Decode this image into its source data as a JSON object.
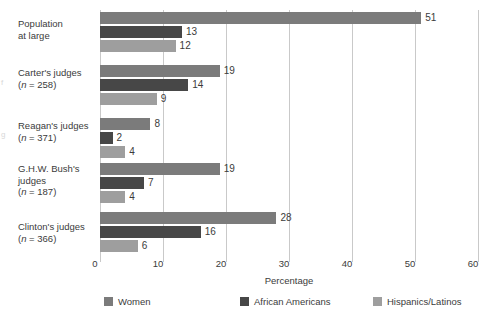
{
  "chart_data": {
    "type": "bar",
    "orientation": "horizontal",
    "title": "",
    "xlabel": "Percentage",
    "ylabel": "",
    "xlim": [
      0,
      60
    ],
    "xticks": [
      0,
      10,
      20,
      30,
      40,
      50,
      60
    ],
    "grid": "vertical",
    "legend_position": "bottom",
    "categories": [
      "Population at large",
      "Carter's judges (n = 258)",
      "Reagan's judges (n = 371)",
      "G.H.W. Bush's judges (n = 187)",
      "Clinton's judges (n = 366)"
    ],
    "series": [
      {
        "name": "Women",
        "color": "#7b7b7b",
        "values": [
          51,
          19,
          8,
          19,
          28
        ]
      },
      {
        "name": "African Americans",
        "color": "#474747",
        "values": [
          13,
          14,
          2,
          7,
          16
        ]
      },
      {
        "name": "Hispanics/Latinos",
        "color": "#9e9e9e",
        "values": [
          12,
          9,
          4,
          4,
          6
        ]
      }
    ]
  },
  "axis": {
    "x_title": "Percentage",
    "ticks": [
      "0",
      "10",
      "20",
      "30",
      "40",
      "50",
      "60"
    ]
  },
  "groups": [
    {
      "lines": [
        "Population",
        "at large"
      ],
      "n_label": "",
      "values": {
        "women": "51",
        "african": "13",
        "hispanic": "12"
      }
    },
    {
      "lines": [
        "Carter's judges"
      ],
      "n_label": "(n = 258)",
      "values": {
        "women": "19",
        "african": "14",
        "hispanic": "9"
      }
    },
    {
      "lines": [
        "Reagan's judges"
      ],
      "n_label": "(n = 371)",
      "values": {
        "women": "8",
        "african": "2",
        "hispanic": "4"
      }
    },
    {
      "lines": [
        "G.H.W. Bush's",
        "judges"
      ],
      "n_label": "(n = 187)",
      "values": {
        "women": "19",
        "african": "7",
        "hispanic": "4"
      }
    },
    {
      "lines": [
        "Clinton's judges"
      ],
      "n_label": "(n = 366)",
      "values": {
        "women": "28",
        "african": "16",
        "hispanic": "6"
      }
    }
  ],
  "legend": {
    "items": [
      {
        "label": "Women",
        "color": "#7b7b7b"
      },
      {
        "label": "African Americans",
        "color": "#474747"
      },
      {
        "label": "Hispanics/Latinos",
        "color": "#9e9e9e"
      }
    ]
  }
}
